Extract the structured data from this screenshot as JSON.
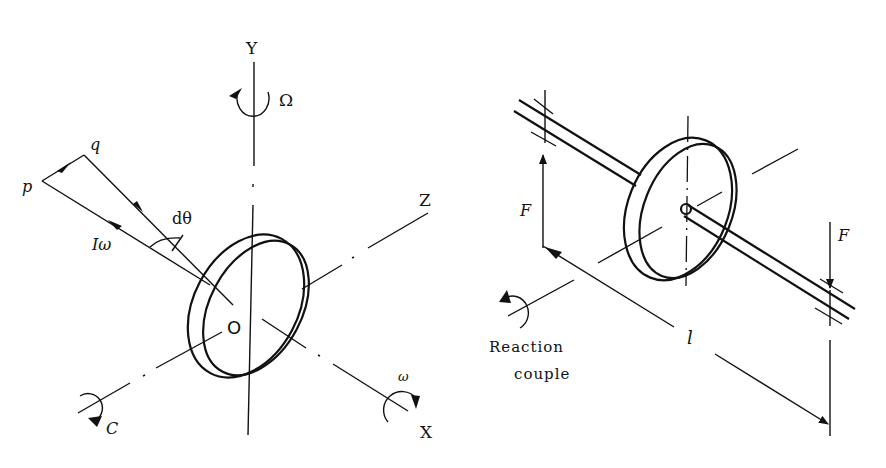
{
  "left_diagram": {
    "axis_y_label": "Y",
    "axis_z_label": "Z",
    "axis_x_label": "X",
    "origin_label": "O",
    "precession_rate_label": "Ω",
    "spin_rate_label": "ω",
    "couple_label": "C",
    "angular_momentum_label": "Iω",
    "angle_label": "dθ",
    "vector_start_label": "p",
    "vector_end_label": "q"
  },
  "right_diagram": {
    "force_left_label": "F",
    "force_right_label": "F",
    "length_label": "l",
    "reaction_couple_label_line1": "Reaction",
    "reaction_couple_label_line2": "couple"
  }
}
